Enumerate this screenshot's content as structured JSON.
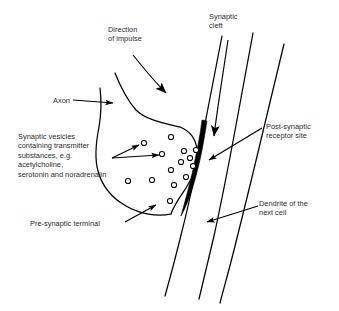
{
  "diagram": {
    "type": "biological-schematic",
    "background_color": "#ffffff",
    "line_color": "#000000",
    "text_color": "#2b2b2b",
    "receptor_band_color": "#000000"
  },
  "labels": {
    "direction_of_impulse": "Direction\nof impulse",
    "synaptic_cleft": "Synaptic\ncleft",
    "axon": "Axon",
    "synaptic_vesicles": "Synaptic vesicles\ncontaining transmitter\nsubstances, e.g.\nacetylcholine,\nserotonin and noradrenalin",
    "post_synaptic_receptor_site": "Post-synaptic\nreceptor site",
    "pre_synaptic_terminal": "Pre-synaptic terminal",
    "dendrite_of_the_next_cell": "Dendrite of the\nnext cell"
  },
  "structures": {
    "vesicle_count": 14,
    "vesicle_radius": 2.6,
    "membrane_lines": 3
  }
}
